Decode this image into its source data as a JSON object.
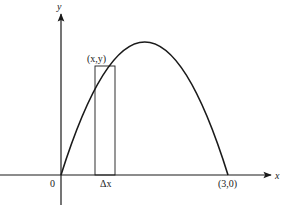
{
  "diagram": {
    "axes": {
      "x_label": "x",
      "y_label": "y",
      "origin_label": "0"
    },
    "curve": {
      "type": "parabola",
      "x_intercepts": [
        "0",
        "(3,0)"
      ],
      "right_intercept_label": "(3,0)"
    },
    "rectangle": {
      "top_point_label": "(x,y)",
      "width_label": "Δx"
    },
    "colors": {
      "stroke": "#1a1a1a",
      "background": "#ffffff"
    }
  }
}
